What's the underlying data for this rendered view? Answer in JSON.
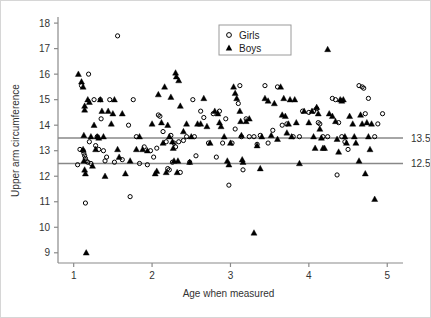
{
  "chart_data": {
    "type": "scatter",
    "title": "",
    "xlabel": "Age when measured",
    "ylabel": "Upper arm circumference",
    "xlim": [
      0.8,
      5.15
    ],
    "ylim": [
      8.6,
      18.2
    ],
    "xticks": [
      1,
      2,
      3,
      4,
      5
    ],
    "xtick_labels": [
      "1",
      "2",
      "3",
      "4",
      "5"
    ],
    "yticks": [
      9,
      10,
      11,
      12,
      13,
      14,
      15,
      16,
      17,
      18
    ],
    "ytick_labels": [
      "9",
      "10",
      "11",
      "12",
      "13",
      "14",
      "15",
      "16",
      "17",
      "18"
    ],
    "grid": false,
    "legend_position": "top-center-right",
    "reference_lines": [
      {
        "name": "upper-reference-line",
        "y": 13.5,
        "label": "13.5",
        "color": "#888888"
      },
      {
        "name": "lower-reference-line",
        "y": 12.5,
        "label": "12.5",
        "color": "#888888"
      }
    ],
    "legend": [
      {
        "name": "Girls",
        "marker": "open-circle",
        "color": "#000000"
      },
      {
        "name": "Boys",
        "marker": "filled-triangle",
        "color": "#000000"
      }
    ],
    "series": [
      {
        "name": "Girls",
        "marker": "open-circle",
        "color": "#000000",
        "points": [
          [
            1.05,
            12.45
          ],
          [
            1.08,
            13.05
          ],
          [
            1.1,
            15.55
          ],
          [
            1.12,
            13.0
          ],
          [
            1.13,
            12.9
          ],
          [
            1.14,
            12.8
          ],
          [
            1.15,
            12.7
          ],
          [
            1.16,
            12.6
          ],
          [
            1.18,
            12.55
          ],
          [
            1.15,
            10.95
          ],
          [
            1.19,
            16.0
          ],
          [
            1.2,
            13.35
          ],
          [
            1.22,
            12.5
          ],
          [
            1.26,
            15.0
          ],
          [
            1.28,
            13.2
          ],
          [
            1.32,
            13.05
          ],
          [
            1.34,
            15.0
          ],
          [
            1.35,
            14.25
          ],
          [
            1.38,
            13.0
          ],
          [
            1.42,
            12.75
          ],
          [
            1.46,
            15.0
          ],
          [
            1.52,
            12.55
          ],
          [
            1.56,
            17.5
          ],
          [
            1.62,
            12.65
          ],
          [
            1.7,
            14.0
          ],
          [
            1.72,
            11.2
          ],
          [
            1.76,
            15.0
          ],
          [
            1.8,
            13.55
          ],
          [
            1.84,
            12.5
          ],
          [
            1.9,
            13.15
          ],
          [
            1.94,
            12.45
          ],
          [
            1.98,
            13.0
          ],
          [
            2.02,
            12.75
          ],
          [
            2.06,
            13.1
          ],
          [
            2.1,
            14.35
          ],
          [
            2.14,
            13.75
          ],
          [
            2.18,
            13.35
          ],
          [
            2.2,
            12.3
          ],
          [
            2.22,
            12.25
          ],
          [
            2.24,
            13.6
          ],
          [
            2.26,
            12.55
          ],
          [
            2.28,
            13.3
          ],
          [
            2.3,
            13.15
          ],
          [
            2.34,
            13.35
          ],
          [
            2.4,
            13.4
          ],
          [
            2.48,
            12.55
          ],
          [
            2.52,
            15.0
          ],
          [
            2.54,
            13.55
          ],
          [
            2.56,
            12.8
          ],
          [
            2.62,
            14.55
          ],
          [
            2.66,
            14.3
          ],
          [
            2.72,
            13.3
          ],
          [
            2.78,
            14.45
          ],
          [
            2.82,
            12.75
          ],
          [
            2.86,
            14.55
          ],
          [
            2.9,
            13.3
          ],
          [
            2.94,
            14.25
          ],
          [
            2.98,
            11.65
          ],
          [
            3.02,
            13.3
          ],
          [
            3.06,
            13.85
          ],
          [
            3.1,
            14.85
          ],
          [
            3.12,
            15.55
          ],
          [
            3.14,
            13.55
          ],
          [
            3.16,
            12.25
          ],
          [
            3.2,
            14.25
          ],
          [
            3.24,
            13.55
          ],
          [
            3.3,
            13.55
          ],
          [
            3.38,
            13.6
          ],
          [
            3.44,
            15.55
          ],
          [
            3.48,
            13.3
          ],
          [
            3.54,
            13.8
          ],
          [
            3.6,
            15.5
          ],
          [
            3.66,
            14.0
          ],
          [
            3.72,
            14.05
          ],
          [
            3.8,
            13.55
          ],
          [
            3.92,
            14.55
          ],
          [
            4.0,
            14.5
          ],
          [
            4.06,
            14.55
          ],
          [
            4.1,
            14.65
          ],
          [
            4.12,
            14.1
          ],
          [
            4.14,
            14.05
          ],
          [
            4.18,
            13.55
          ],
          [
            4.24,
            13.55
          ],
          [
            4.3,
            15.05
          ],
          [
            4.34,
            15.0
          ],
          [
            4.36,
            12.05
          ],
          [
            4.38,
            14.1
          ],
          [
            4.42,
            13.55
          ],
          [
            4.5,
            13.05
          ],
          [
            4.64,
            15.55
          ],
          [
            4.68,
            15.5
          ],
          [
            4.7,
            15.45
          ],
          [
            4.72,
            14.45
          ],
          [
            4.76,
            15.05
          ],
          [
            4.84,
            13.55
          ],
          [
            4.88,
            14.05
          ],
          [
            4.94,
            14.45
          ],
          [
            1.3,
            13.55
          ],
          [
            2.44,
            13.55
          ],
          [
            2.08,
            14.4
          ],
          [
            1.4,
            12.6
          ],
          [
            3.34,
            13.25
          ],
          [
            3.88,
            13.55
          ],
          [
            4.46,
            13.35
          ],
          [
            2.36,
            12.15
          ]
        ]
      },
      {
        "name": "Boys",
        "marker": "filled-triangle",
        "color": "#000000",
        "points": [
          [
            1.06,
            16.0
          ],
          [
            1.1,
            15.7
          ],
          [
            1.12,
            15.5
          ],
          [
            1.14,
            14.75
          ],
          [
            1.14,
            14.6
          ],
          [
            1.13,
            13.6
          ],
          [
            1.12,
            13.05
          ],
          [
            1.13,
            12.6
          ],
          [
            1.14,
            12.25
          ],
          [
            1.15,
            12.1
          ],
          [
            1.16,
            9.0
          ],
          [
            1.18,
            15.0
          ],
          [
            1.2,
            14.9
          ],
          [
            1.22,
            13.55
          ],
          [
            1.24,
            12.4
          ],
          [
            1.26,
            14.0
          ],
          [
            1.28,
            13.05
          ],
          [
            1.3,
            13.55
          ],
          [
            1.32,
            13.5
          ],
          [
            1.34,
            15.0
          ],
          [
            1.36,
            14.55
          ],
          [
            1.38,
            13.55
          ],
          [
            1.4,
            12.0
          ],
          [
            1.44,
            14.55
          ],
          [
            1.48,
            14.05
          ],
          [
            1.5,
            14.45
          ],
          [
            1.52,
            15.0
          ],
          [
            1.56,
            13.05
          ],
          [
            1.58,
            12.75
          ],
          [
            1.62,
            14.45
          ],
          [
            1.66,
            12.1
          ],
          [
            1.72,
            12.6
          ],
          [
            1.8,
            13.05
          ],
          [
            1.88,
            13.05
          ],
          [
            1.94,
            13.0
          ],
          [
            2.0,
            14.05
          ],
          [
            2.04,
            12.1
          ],
          [
            2.08,
            15.2
          ],
          [
            2.12,
            14.1
          ],
          [
            2.16,
            15.5
          ],
          [
            2.18,
            12.15
          ],
          [
            2.2,
            14.0
          ],
          [
            2.22,
            13.55
          ],
          [
            2.24,
            15.1
          ],
          [
            2.26,
            13.35
          ],
          [
            2.27,
            13.1
          ],
          [
            2.28,
            12.6
          ],
          [
            2.3,
            16.05
          ],
          [
            2.31,
            15.9
          ],
          [
            2.32,
            12.15
          ],
          [
            2.33,
            12.6
          ],
          [
            2.34,
            15.75
          ],
          [
            2.36,
            14.75
          ],
          [
            2.4,
            13.75
          ],
          [
            2.44,
            14.05
          ],
          [
            2.48,
            12.55
          ],
          [
            2.58,
            14.05
          ],
          [
            2.62,
            14.05
          ],
          [
            2.66,
            15.05
          ],
          [
            2.7,
            13.95
          ],
          [
            2.74,
            13.3
          ],
          [
            2.8,
            14.55
          ],
          [
            2.84,
            14.45
          ],
          [
            2.86,
            14.1
          ],
          [
            2.88,
            13.95
          ],
          [
            2.92,
            13.55
          ],
          [
            2.96,
            12.6
          ],
          [
            2.98,
            12.45
          ],
          [
            3.04,
            15.5
          ],
          [
            3.06,
            15.25
          ],
          [
            3.08,
            15.05
          ],
          [
            3.12,
            14.55
          ],
          [
            3.13,
            14.15
          ],
          [
            3.14,
            13.6
          ],
          [
            3.15,
            12.65
          ],
          [
            3.16,
            12.55
          ],
          [
            3.2,
            14.15
          ],
          [
            3.24,
            14.25
          ],
          [
            3.3,
            9.78
          ],
          [
            3.34,
            13.2
          ],
          [
            3.38,
            12.3
          ],
          [
            3.44,
            15.05
          ],
          [
            3.48,
            14.95
          ],
          [
            3.52,
            13.6
          ],
          [
            3.56,
            14.85
          ],
          [
            3.6,
            13.45
          ],
          [
            3.64,
            15.5
          ],
          [
            3.66,
            14.4
          ],
          [
            3.68,
            15.05
          ],
          [
            3.7,
            14.35
          ],
          [
            3.72,
            13.7
          ],
          [
            3.74,
            14.05
          ],
          [
            3.76,
            15.0
          ],
          [
            3.78,
            13.55
          ],
          [
            3.82,
            15.0
          ],
          [
            3.84,
            14.1
          ],
          [
            3.88,
            12.5
          ],
          [
            3.94,
            14.55
          ],
          [
            4.0,
            14.1
          ],
          [
            4.04,
            14.55
          ],
          [
            4.06,
            13.55
          ],
          [
            4.08,
            13.1
          ],
          [
            4.1,
            14.7
          ],
          [
            4.12,
            14.45
          ],
          [
            4.14,
            13.85
          ],
          [
            4.16,
            13.5
          ],
          [
            4.18,
            13.1
          ],
          [
            4.24,
            16.97
          ],
          [
            4.26,
            14.45
          ],
          [
            4.3,
            14.35
          ],
          [
            4.34,
            14.15
          ],
          [
            4.36,
            13.45
          ],
          [
            4.38,
            12.95
          ],
          [
            4.4,
            15.0
          ],
          [
            4.42,
            14.95
          ],
          [
            4.44,
            15.0
          ],
          [
            4.46,
            13.55
          ],
          [
            4.48,
            13.3
          ],
          [
            4.52,
            14.35
          ],
          [
            4.56,
            14.05
          ],
          [
            4.6,
            13.3
          ],
          [
            4.64,
            12.6
          ],
          [
            4.66,
            14.4
          ],
          [
            4.68,
            14.05
          ],
          [
            4.72,
            12.1
          ],
          [
            4.74,
            14.1
          ],
          [
            4.76,
            13.55
          ],
          [
            4.78,
            13.05
          ],
          [
            4.84,
            11.1
          ],
          [
            4.8,
            14.05
          ],
          [
            2.5,
            13.55
          ],
          [
            1.84,
            13.55
          ],
          [
            2.06,
            12.2
          ],
          [
            3.0,
            13.3
          ],
          [
            3.4,
            13.55
          ],
          [
            4.2,
            13.1
          ],
          [
            4.58,
            13.55
          ],
          [
            2.14,
            13.3
          ]
        ]
      }
    ]
  },
  "axes": {
    "spine_color": "#8a8a8a",
    "tick_color": "#8a8a8a"
  }
}
